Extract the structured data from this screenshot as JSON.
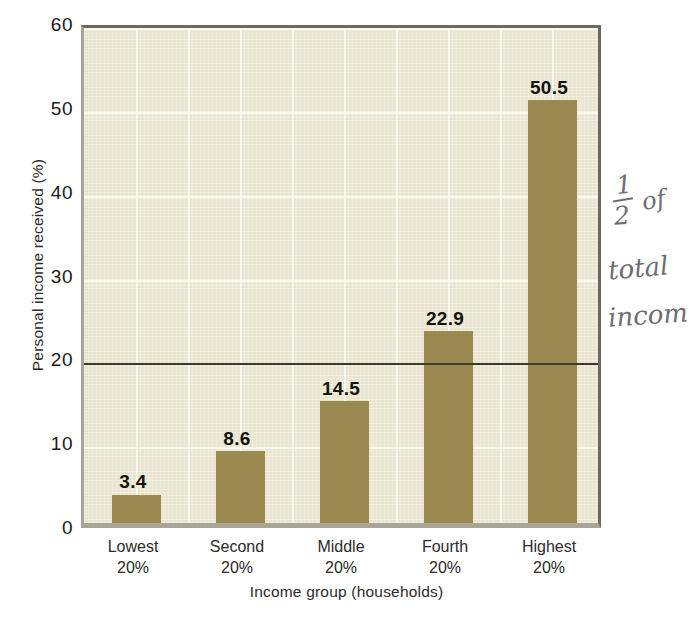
{
  "chart_data": {
    "type": "bar",
    "title": "",
    "categories": [
      "Lowest 20%",
      "Second 20%",
      "Middle 20%",
      "Fourth 20%",
      "Highest 20%"
    ],
    "category_lines": [
      [
        "Lowest",
        "20%"
      ],
      [
        "Second",
        "20%"
      ],
      [
        "Middle",
        "20%"
      ],
      [
        "Fourth",
        "20%"
      ],
      [
        "Highest",
        "20%"
      ]
    ],
    "values": [
      3.4,
      8.6,
      14.5,
      22.9,
      50.5
    ],
    "value_labels": [
      "3.4",
      "8.6",
      "14.5",
      "22.9",
      "50.5"
    ],
    "xlabel": "Income group (households)",
    "ylabel": "Personal income received (%)",
    "ylim": [
      0,
      60
    ],
    "ytick_values": [
      0,
      10,
      20,
      30,
      40,
      50,
      60
    ],
    "ytick_labels": [
      "0",
      "10",
      "20",
      "30",
      "40",
      "50",
      "60"
    ],
    "grid": true,
    "legend": "none",
    "reference_line": {
      "value": 20,
      "color": "#3a3a35"
    },
    "colors": {
      "bar": "#9a8a4f",
      "plot_background": "#e9e4cd",
      "page_background": "#ffffff",
      "text": "#1a1a1a",
      "gridline": "#ffffff"
    }
  },
  "annotations": {
    "handwritten": {
      "fraction_numerator": "1",
      "fraction_denominator": "2",
      "word_of": "of",
      "word_total": "total",
      "word_income": "incom"
    }
  }
}
